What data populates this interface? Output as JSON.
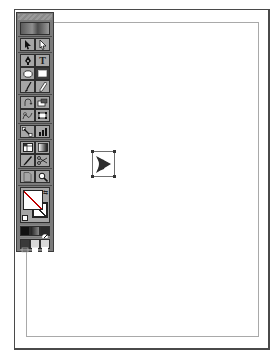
{
  "app": "Illustrator",
  "document": {
    "page_border_color": "#4a4a4a",
    "margin_border_color": "#a9a9a9",
    "selected_object": {
      "shape": "arrow-brush-shape",
      "fill": "#2e2e2e",
      "bounds": {
        "x": 92,
        "y": 151,
        "width": 23,
        "height": 26
      }
    }
  },
  "toolbox": {
    "tools": [
      {
        "name": "selection-tool",
        "glyph": "➤",
        "active": false
      },
      {
        "name": "direct-selection-tool",
        "glyph": "➤",
        "active": false
      },
      {
        "name": "pen-tool",
        "glyph": "✒",
        "active": false
      },
      {
        "name": "type-tool",
        "glyph": "T",
        "active": false
      },
      {
        "name": "ellipse-tool",
        "glyph": "⬭",
        "active": false
      },
      {
        "name": "rectangle-tool",
        "glyph": "■",
        "active": true
      },
      {
        "name": "paintbrush-tool",
        "glyph": "/",
        "active": false
      },
      {
        "name": "pencil-tool",
        "glyph": "✎",
        "active": false
      },
      {
        "name": "rotate-tool",
        "glyph": "↺",
        "active": false
      },
      {
        "name": "scale-tool",
        "glyph": "⧉",
        "active": false
      },
      {
        "name": "blend-tool",
        "glyph": "⚭",
        "active": false
      },
      {
        "name": "free-transform-tool",
        "glyph": "⌗",
        "active": false
      },
      {
        "name": "symbol-sprayer-tool",
        "glyph": "⤡",
        "active": false
      },
      {
        "name": "graph-tool",
        "glyph": "▟",
        "active": false
      },
      {
        "name": "mesh-tool",
        "glyph": "⊞",
        "active": false
      },
      {
        "name": "gradient-tool",
        "glyph": "◧",
        "active": false
      },
      {
        "name": "eyedropper-tool",
        "glyph": "⁄",
        "active": false
      },
      {
        "name": "scissors-tool",
        "glyph": "✂",
        "active": false
      },
      {
        "name": "hand-tool",
        "glyph": "☐",
        "active": false
      },
      {
        "name": "zoom-tool",
        "glyph": "⚲",
        "active": false
      }
    ],
    "fill_stroke": {
      "fill": "none",
      "stroke": "none"
    },
    "color_modes": [
      "color",
      "gradient",
      "none"
    ],
    "screen_modes": [
      "standard",
      "full-menu",
      "full"
    ],
    "colors": {
      "panel_bg": "#7b7b7b",
      "button_bg": "#a6a6a6",
      "active_button_bg": "#3e3e3e",
      "border": "#2e2e2e"
    }
  }
}
